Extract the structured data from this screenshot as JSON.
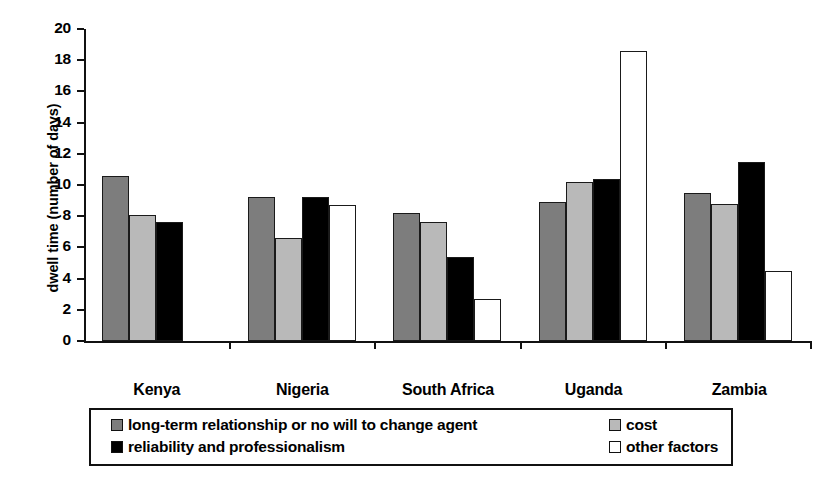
{
  "chart_data": {
    "type": "bar",
    "title": "",
    "xlabel": "",
    "ylabel": "dwell time (number of days)",
    "ylim": [
      0,
      20
    ],
    "yticks": [
      0,
      2,
      4,
      6,
      8,
      10,
      12,
      14,
      16,
      18,
      20
    ],
    "grid": false,
    "legend_position": "bottom",
    "categories": [
      "Kenya",
      "Nigeria",
      "South Africa",
      "Uganda",
      "Zambia"
    ],
    "series": [
      {
        "name": "long-term relationship or no will to change agent",
        "color": "#7d7d7d",
        "values": [
          10.6,
          9.2,
          8.2,
          8.9,
          9.5
        ]
      },
      {
        "name": "cost",
        "color": "#b9b9b9",
        "values": [
          8.1,
          6.6,
          7.6,
          10.2,
          8.8
        ]
      },
      {
        "name": "reliability and professionalism",
        "color": "#000000",
        "values": [
          7.6,
          9.2,
          5.4,
          10.4,
          11.5
        ]
      },
      {
        "name": "other factors",
        "color": "#ffffff",
        "values": [
          null,
          8.7,
          2.7,
          18.6,
          4.5
        ]
      }
    ]
  },
  "legend": {
    "entries": [
      {
        "label": "long-term relationship or no will to change agent",
        "swatch": "dark-gray-swatch-icon"
      },
      {
        "label": "reliability and professionalism",
        "swatch": "black-swatch-icon"
      },
      {
        "label": "cost",
        "swatch": "light-gray-swatch-icon"
      },
      {
        "label": "other factors",
        "swatch": "white-swatch-icon"
      }
    ]
  }
}
